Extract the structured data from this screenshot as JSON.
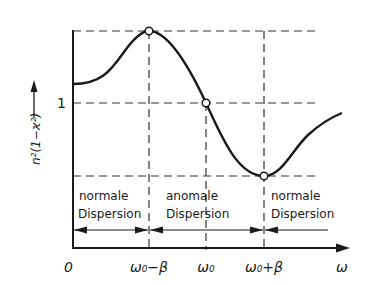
{
  "diagram": {
    "type": "dispersion-curve",
    "y_axis_label": "n²(1−ϰ²)",
    "y_tick_label": "1",
    "origin_label": "0",
    "x_axis_label": "ω",
    "x_ticks": [
      {
        "label": "ω₀−β",
        "x": 149
      },
      {
        "label": "ω₀",
        "x": 206
      },
      {
        "label": "ω₀+β",
        "x": 264
      }
    ],
    "regions": [
      {
        "line1": "normale",
        "line2": "Dispersion"
      },
      {
        "line1": "anomale",
        "line2": "Dispersion"
      },
      {
        "line1": "normale",
        "line2": "Dispersion"
      }
    ],
    "marked_points": [
      {
        "name": "maximum",
        "at": "ω₀−β"
      },
      {
        "name": "unity-crossing",
        "at": "ω₀"
      },
      {
        "name": "minimum",
        "at": "ω₀+β"
      }
    ],
    "colors": {
      "ink": "#1a1a1a",
      "background": "#ffffff"
    }
  }
}
